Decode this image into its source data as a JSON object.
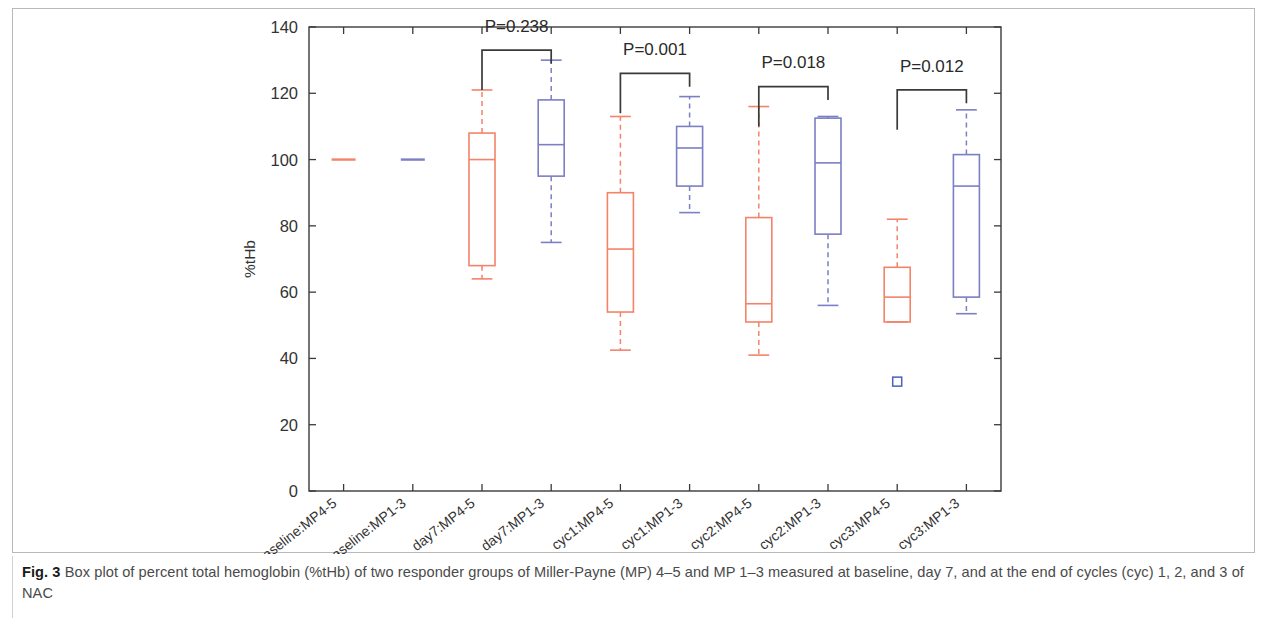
{
  "caption": {
    "label": "Fig. 3",
    "text": "Box plot of percent total hemoglobin (%tHb) of two responder groups of Miller-Payne (MP) 4–5 and MP 1–3 measured at baseline, day 7, and at the end of cycles (cyc) 1, 2, and 3 of NAC"
  },
  "colors": {
    "mp45": "#f4836a",
    "mp13": "#7b7fc4",
    "axis": "#3a3a3a",
    "annotation": "#3a3a3a",
    "background": "#ffffff"
  },
  "chart_data": {
    "type": "box",
    "title": "",
    "xlabel": "",
    "ylabel": "%tHb",
    "ylim": [
      0,
      140
    ],
    "yticks": [
      0,
      20,
      40,
      60,
      80,
      100,
      120,
      140
    ],
    "ytick_labels": [
      "0",
      "20",
      "40",
      "60",
      "80",
      "100",
      "120",
      "140"
    ],
    "grid": false,
    "legend": "none",
    "categories": [
      "baseline:MP4-5",
      "baseline:MP1-3",
      "day7:MP4-5",
      "day7:MP1-3",
      "cyc1:MP4-5",
      "cyc1:MP1-3",
      "cyc2:MP4-5",
      "cyc2:MP1-3",
      "cyc3:MP4-5",
      "cyc3:MP1-3"
    ],
    "boxes": [
      {
        "category": "baseline:MP4-5",
        "group": "MP4-5",
        "color": "#f4836a",
        "whisker_low": 100,
        "q1": 100,
        "median": 100,
        "q3": 100,
        "whisker_high": 100,
        "outliers": [],
        "degenerate": true
      },
      {
        "category": "baseline:MP1-3",
        "group": "MP1-3",
        "color": "#7b7fc4",
        "whisker_low": 100,
        "q1": 100,
        "median": 100,
        "q3": 100,
        "whisker_high": 100,
        "outliers": [],
        "degenerate": true
      },
      {
        "category": "day7:MP4-5",
        "group": "MP4-5",
        "color": "#f4836a",
        "whisker_low": 64,
        "q1": 68,
        "median": 100,
        "q3": 108,
        "whisker_high": 121,
        "outliers": [],
        "degenerate": false
      },
      {
        "category": "day7:MP1-3",
        "group": "MP1-3",
        "color": "#7b7fc4",
        "whisker_low": 75,
        "q1": 95,
        "median": 104.5,
        "q3": 118,
        "whisker_high": 130,
        "outliers": [],
        "degenerate": false
      },
      {
        "category": "cyc1:MP4-5",
        "group": "MP4-5",
        "color": "#f4836a",
        "whisker_low": 42.5,
        "q1": 54,
        "median": 73,
        "q3": 90,
        "whisker_high": 113,
        "outliers": [],
        "degenerate": false
      },
      {
        "category": "cyc1:MP1-3",
        "group": "MP1-3",
        "color": "#7b7fc4",
        "whisker_low": 84,
        "q1": 92,
        "median": 103.5,
        "q3": 110,
        "whisker_high": 119,
        "outliers": [],
        "degenerate": false
      },
      {
        "category": "cyc2:MP4-5",
        "group": "MP4-5",
        "color": "#f4836a",
        "whisker_low": 41,
        "q1": 51,
        "median": 56.5,
        "q3": 82.5,
        "whisker_high": 116,
        "outliers": [],
        "degenerate": false
      },
      {
        "category": "cyc2:MP1-3",
        "group": "MP1-3",
        "color": "#7b7fc4",
        "whisker_low": 56,
        "q1": 77.5,
        "median": 99,
        "q3": 112.5,
        "whisker_high": 113,
        "outliers": [],
        "degenerate": false
      },
      {
        "category": "cyc3:MP4-5",
        "group": "MP4-5",
        "color": "#f4836a",
        "whisker_low": 51,
        "q1": 51,
        "median": 58.5,
        "q3": 67.5,
        "whisker_high": 82,
        "outliers": [
          33
        ],
        "degenerate": false
      },
      {
        "category": "cyc3:MP1-3",
        "group": "MP1-3",
        "color": "#7b7fc4",
        "whisker_low": 53.5,
        "q1": 58.5,
        "median": 92,
        "q3": 101.5,
        "whisker_high": 115,
        "outliers": [],
        "degenerate": false
      }
    ],
    "annotations": [
      {
        "label": "P=0.238",
        "from": "day7:MP4-5",
        "to": "day7:MP1-3",
        "bracket_value": 133,
        "text_value": 140
      },
      {
        "label": "P=0.001",
        "from": "cyc1:MP4-5",
        "to": "cyc1:MP1-3",
        "bracket_value": 126,
        "text_value": 133
      },
      {
        "label": "P=0.018",
        "from": "cyc2:MP4-5",
        "to": "cyc2:MP1-3",
        "bracket_value": 122,
        "text_value": 129
      },
      {
        "label": "P=0.012",
        "from": "cyc3:MP4-5",
        "to": "cyc3:MP1-3",
        "bracket_value": 121,
        "text_value": 128
      }
    ]
  }
}
